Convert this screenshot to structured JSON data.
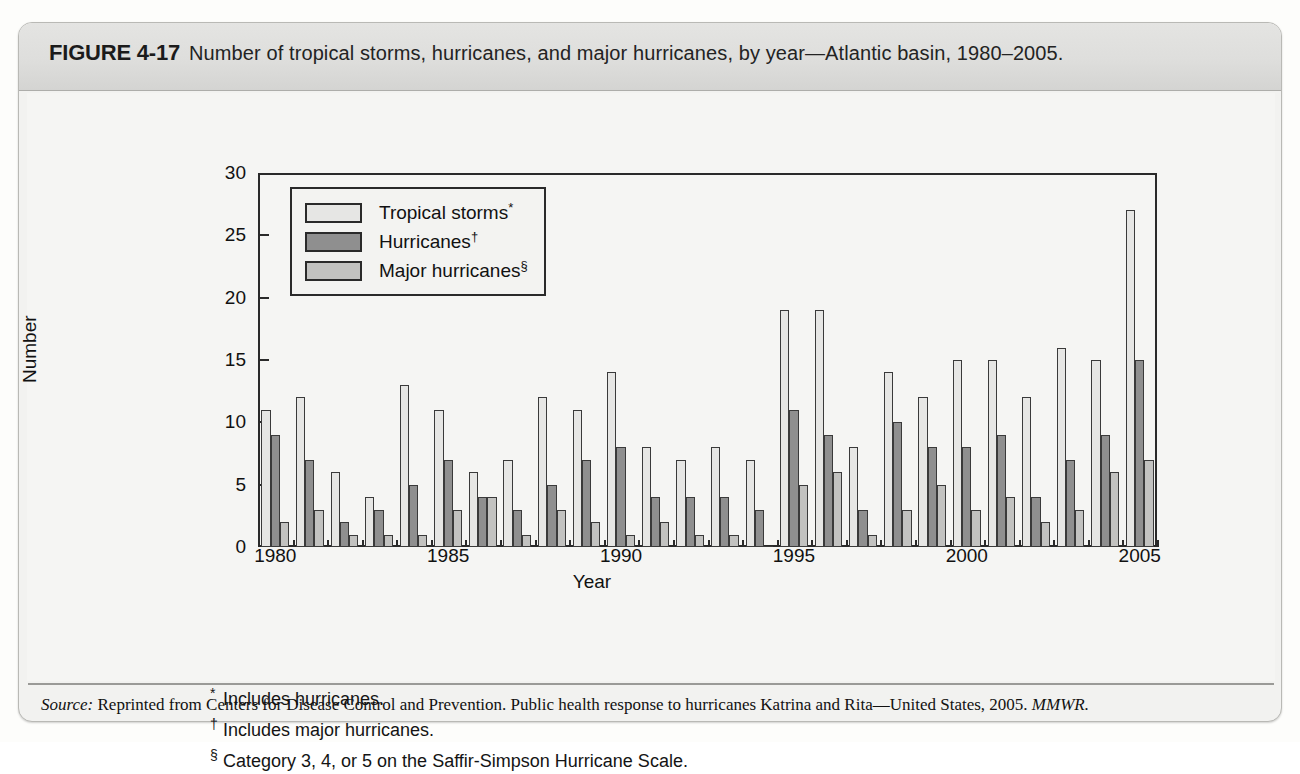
{
  "figure": {
    "label": "FIGURE 4-17",
    "caption": "Number of tropical storms, hurricanes, and major hurricanes, by year—Atlantic basin, 1980–2005."
  },
  "footnotes": [
    {
      "mark": "*",
      "text": "Includes hurricanes."
    },
    {
      "mark": "†",
      "text": "Includes major hurricanes."
    },
    {
      "mark": "§",
      "text": "Category 3, 4, or 5 on the Saffir-Simpson Hurricane Scale."
    }
  ],
  "source": {
    "prefix": "Source:",
    "text": "Reprinted from Centers for Disease Control and Prevention. Public health response to hurricanes Katrina and Rita—United States, 2005.",
    "journal": "MMWR."
  },
  "colors": {
    "tropical_storms": "#e6e6e4",
    "hurricanes": "#8f8f8f",
    "major_hurricanes": "#c2c2c0",
    "axis": "#2a2a2a",
    "plot_background": "#f5f5f3",
    "card_background": "#f2f2f0",
    "header_band": "#dededc"
  },
  "chart_data": {
    "type": "bar",
    "title": "Number of tropical storms, hurricanes, and major hurricanes, by year—Atlantic basin, 1980–2005",
    "xlabel": "Year",
    "ylabel": "Number",
    "ylim": [
      0,
      30
    ],
    "yticks": [
      0,
      5,
      10,
      15,
      20,
      25,
      30
    ],
    "xticks": [
      1980,
      1985,
      1990,
      1995,
      2000,
      2005
    ],
    "grid": false,
    "legend_position": "upper-left-inside",
    "categories": [
      1980,
      1981,
      1982,
      1983,
      1984,
      1985,
      1986,
      1987,
      1988,
      1989,
      1990,
      1991,
      1992,
      1993,
      1994,
      1995,
      1996,
      1997,
      1998,
      1999,
      2000,
      2001,
      2002,
      2003,
      2004,
      2005
    ],
    "series": [
      {
        "name": "Tropical storms*",
        "legend_label": "Tropical storms",
        "legend_sup": "*",
        "color": "#e6e6e4",
        "values": [
          11,
          12,
          6,
          4,
          13,
          11,
          6,
          7,
          12,
          11,
          14,
          8,
          7,
          8,
          7,
          19,
          19,
          8,
          14,
          12,
          15,
          15,
          12,
          16,
          15,
          27
        ]
      },
      {
        "name": "Hurricanes†",
        "legend_label": "Hurricanes",
        "legend_sup": "†",
        "color": "#8f8f8f",
        "values": [
          9,
          7,
          2,
          3,
          5,
          7,
          4,
          3,
          5,
          7,
          8,
          4,
          4,
          4,
          3,
          11,
          9,
          3,
          10,
          8,
          8,
          9,
          4,
          7,
          9,
          15
        ]
      },
      {
        "name": "Major hurricanes §",
        "legend_label": "Major hurricanes",
        "legend_sup": "§",
        "color": "#c2c2c0",
        "values": [
          2,
          3,
          1,
          1,
          1,
          3,
          4,
          1,
          3,
          2,
          1,
          2,
          1,
          1,
          0,
          5,
          6,
          1,
          3,
          5,
          3,
          4,
          2,
          3,
          6,
          7
        ]
      }
    ]
  }
}
